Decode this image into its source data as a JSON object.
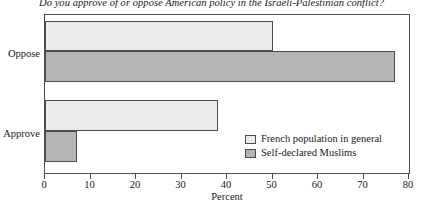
{
  "chart_data": {
    "type": "bar",
    "orientation": "horizontal",
    "title": "Do you approve of or oppose American policy in the Israeli-Palestinian conflict?",
    "xlabel": "Percent",
    "ylabel": "",
    "categories": [
      "Approve",
      "Oppose"
    ],
    "xlim": [
      0,
      80
    ],
    "xticks": [
      0,
      10,
      20,
      30,
      40,
      50,
      60,
      70,
      80
    ],
    "xticklabels": [
      "0",
      "10",
      "20",
      "30",
      "40",
      "50",
      "60",
      "70",
      "80"
    ],
    "grid": false,
    "legend_position": "inside lower-right",
    "series": [
      {
        "name": "French population in general",
        "color": "#ebebeb",
        "values": [
          38,
          50
        ]
      },
      {
        "name": "Self-declared Muslims",
        "color": "#b5b5b5",
        "values": [
          7,
          77
        ]
      }
    ]
  },
  "axis": {
    "category_top": "Oppose",
    "category_bottom": "Approve",
    "x_title": "Percent"
  },
  "legend": {
    "items": [
      {
        "label": "French population in general",
        "swatch": "light"
      },
      {
        "label": "Self-declared Muslims",
        "swatch": "dark"
      }
    ]
  },
  "colors": {
    "light_bar": "#ebebeb",
    "dark_bar": "#b5b5b5",
    "outline": "#4d4d4d",
    "background": "#ffffff"
  }
}
